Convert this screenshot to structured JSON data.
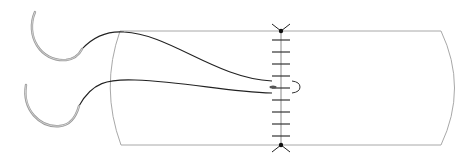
{
  "diagram": {
    "type": "surgical-suture-illustration",
    "colors": {
      "background": "#ffffff",
      "tube_outline": "#a8a8a8",
      "suture_line": "#8a8a8a",
      "stitch_marks": "#333333",
      "thread": "#222222",
      "needle_outer": "#9a9a9a",
      "needle_inner": "#d0d0d0",
      "anchor": "#111111"
    },
    "elements": {
      "tube": {
        "label": "tissue-tube"
      },
      "incision": {
        "label": "suture-line",
        "stitch_count": 9
      },
      "needles": [
        {
          "label": "upper-needle"
        },
        {
          "label": "lower-needle"
        }
      ],
      "threads": [
        {
          "label": "upper-thread"
        },
        {
          "label": "lower-thread"
        }
      ],
      "anchors": [
        {
          "label": "top-anchor"
        },
        {
          "label": "bottom-anchor"
        }
      ],
      "loop": {
        "label": "stitch-loop"
      }
    }
  }
}
